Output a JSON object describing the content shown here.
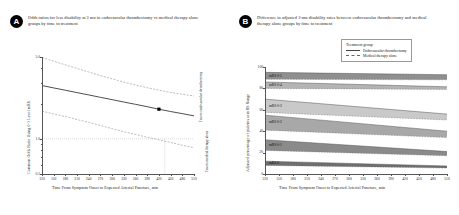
{
  "figure": {
    "background": "#ffffff",
    "panels": [
      {
        "letter": "A",
        "title": "Odds ratios for less disability at 3 mo in endovascular thrombectomy vs medical therapy alone groups by time to treatment"
      },
      {
        "letter": "B",
        "title": "Difference in adjusted 3-mo disability rates between endovascular thrombectomy and medical therapy alone groups by time to treatment"
      }
    ]
  },
  "panel_a": {
    "xlabel": "Time From Symptom Onset to Expected Arterial Puncture,  min",
    "ylabel": "Common Odds Ratio Using 0-1 Level mRS",
    "annotation_up": "Favors endovascular thrombectomy",
    "annotation_down": "Favors medical therapy alone",
    "marker_label": "",
    "reference_value": "1.0"
  },
  "panel_b": {
    "xlabel": "Time From Symptom Onset to Expected Arterial Puncture,  min",
    "ylabel": "Adjusted percentage of patients at mRS Range",
    "legend": {
      "title": "Treatment group",
      "items": [
        {
          "label": "Endovascular thrombectomy",
          "style": "solid"
        },
        {
          "label": "Medical therapy alone",
          "style": "dashed"
        }
      ]
    },
    "band_labels": [
      "mRS 0-5",
      "mRS 0-4",
      "mRS 0-3",
      "mRS 0-2",
      "mRS 0-1",
      "mRS 0"
    ]
  },
  "chart_data": [
    {
      "type": "line",
      "panel": "A",
      "title": "Odds ratios for less disability at 3 mo in endovascular thrombectomy vs medical therapy alone groups by time to treatment",
      "xlabel": "Time From Symptom Onset to Expected Arterial Puncture,  min",
      "ylabel": "Common Odds Ratio Using 0-1 Level mRS",
      "x": [
        120,
        150,
        180,
        210,
        240,
        270,
        300,
        330,
        360,
        390,
        420,
        450,
        480,
        510
      ],
      "xlim": [
        120,
        510
      ],
      "ylim": [
        0.5,
        5.0
      ],
      "yscale": "log",
      "yticks": [
        0.5,
        1.0,
        5.0
      ],
      "ytick_labels": [
        "0.5",
        "1.0",
        "5.0"
      ],
      "grid": false,
      "series": [
        {
          "name": "Common odds ratio (point estimate)",
          "style": "solid",
          "values": [
            2.85,
            2.72,
            2.6,
            2.48,
            2.37,
            2.26,
            2.16,
            2.06,
            1.97,
            1.88,
            1.79,
            1.71,
            1.64,
            1.57
          ]
        },
        {
          "name": "Upper 95% CI",
          "style": "dashed",
          "values": [
            4.95,
            4.6,
            4.28,
            3.99,
            3.72,
            3.47,
            3.25,
            3.05,
            2.88,
            2.73,
            2.6,
            2.49,
            2.4,
            2.32
          ]
        },
        {
          "name": "Lower 95% CI",
          "style": "dashed",
          "values": [
            1.72,
            1.63,
            1.55,
            1.46,
            1.38,
            1.3,
            1.22,
            1.15,
            1.09,
            1.03,
            0.98,
            0.93,
            0.88,
            0.84
          ]
        }
      ],
      "reference_line": {
        "y": 1.0,
        "style": "dotted"
      },
      "marker": {
        "x": 420,
        "y": 1.79,
        "shape": "square",
        "color": "#000000"
      },
      "drop_line": {
        "x": 435,
        "style": "dotted"
      },
      "annotations": [
        {
          "text": "Favors endovascular thrombectomy",
          "orientation": "vertical",
          "position": "right-upper"
        },
        {
          "text": "Favors medical therapy alone",
          "orientation": "vertical",
          "position": "right-lower"
        }
      ]
    },
    {
      "type": "area",
      "panel": "B",
      "title": "Difference in adjusted 3-mo disability rates between endovascular thrombectomy and medical therapy alone groups by time to treatment",
      "xlabel": "Time From Symptom Onset to Expected Arterial Puncture,  min",
      "ylabel": "Adjusted percentage of patients at mRS Range",
      "x": [
        120,
        510
      ],
      "xlim": [
        120,
        510
      ],
      "ylim": [
        0,
        100
      ],
      "yticks": [
        0,
        20,
        40,
        60,
        80,
        100
      ],
      "ytick_labels": [
        "0",
        "20",
        "40",
        "60",
        "80",
        "100"
      ],
      "xticks": [
        120,
        150,
        180,
        210,
        240,
        270,
        300,
        330,
        360,
        390,
        420,
        450,
        480,
        510
      ],
      "grid": false,
      "legend_position": "top-right",
      "bands": [
        {
          "label": "mRS 0-5",
          "shade": "#8f8f8f",
          "thrombectomy": [
            95.0,
            92.8
          ],
          "medical": [
            88.5,
            88.0
          ]
        },
        {
          "label": "mRS 0-4",
          "shade": "#b4b4b4",
          "thrombectomy": [
            86.0,
            81.5
          ],
          "medical": [
            80.0,
            79.0
          ]
        },
        {
          "label": "mRS 0-3",
          "shade": "#c9c9c9",
          "thrombectomy": [
            70.0,
            56.0
          ],
          "medical": [
            57.5,
            50.5
          ]
        },
        {
          "label": "mRS 0-2",
          "shade": "#a8a8a8",
          "thrombectomy": [
            55.0,
            40.0
          ],
          "medical": [
            41.0,
            34.0
          ]
        },
        {
          "label": "mRS 0-1",
          "shade": "#8a8a8a",
          "thrombectomy": [
            32.0,
            21.0
          ],
          "medical": [
            22.0,
            17.0
          ]
        },
        {
          "label": "mRS 0",
          "shade": "#6f6f6f",
          "thrombectomy": [
            12.0,
            7.5
          ],
          "medical": [
            8.0,
            5.5
          ]
        }
      ]
    }
  ]
}
